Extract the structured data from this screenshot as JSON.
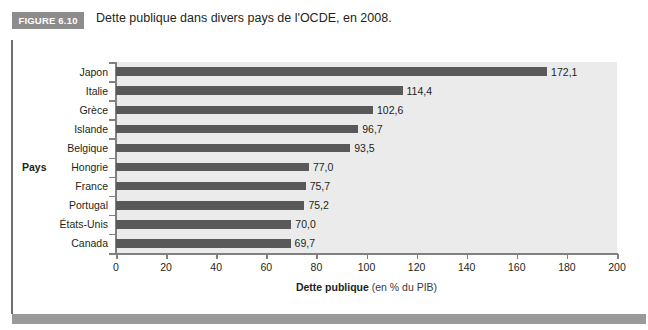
{
  "figure": {
    "badge_label": "FIGURE 6.10",
    "title": "Dette publique dans divers pays de l'OCDE, en 2008."
  },
  "colors": {
    "badge_bg": "#8c8c8c",
    "plot_bg": "#ebebeb",
    "bar": "#595959",
    "axis": "#808080",
    "band": "#9a9a9a",
    "text": "#231f20"
  },
  "chart_data": {
    "type": "bar",
    "orientation": "horizontal",
    "title": "Dette publique dans divers pays de l'OCDE, en 2008.",
    "xlabel_bold": "Dette publique",
    "xlabel_note": "(en % du PIB)",
    "ylabel": "Pays",
    "categories": [
      "Japon",
      "Italie",
      "Grèce",
      "Islande",
      "Belgique",
      "Hongrie",
      "France",
      "Portugal",
      "États-Unis",
      "Canada"
    ],
    "values": [
      172.1,
      114.4,
      102.6,
      96.7,
      93.5,
      77.0,
      75.7,
      75.2,
      70.0,
      69.7
    ],
    "data_labels": [
      "172,1",
      "114,4",
      "102,6",
      "96,7",
      "93,5",
      "77,0",
      "75,7",
      "75,2",
      "70,0",
      "69,7"
    ],
    "xlim": [
      0,
      200
    ],
    "xticks": [
      0,
      20,
      40,
      60,
      80,
      100,
      120,
      140,
      160,
      180,
      200
    ],
    "xtick_labels": [
      "0",
      "20",
      "40",
      "60",
      "80",
      "100",
      "120",
      "140",
      "160",
      "180",
      "200"
    ],
    "grid": false,
    "legend": false
  }
}
